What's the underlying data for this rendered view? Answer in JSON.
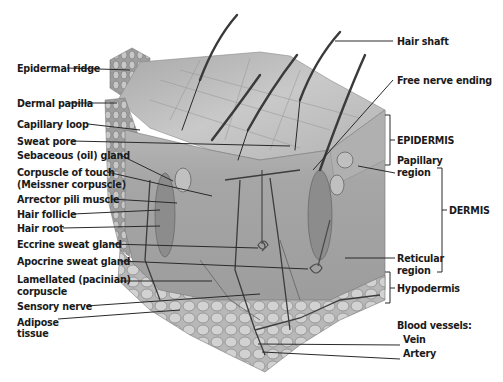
{
  "diagram": {
    "type": "anatomical-cross-section",
    "colors": {
      "background": "#ffffff",
      "label_text": "#1a1a1a",
      "leader_line": "#2a2a2a",
      "epidermis_surface": "#b9b9b9",
      "dermis": "#a8a8a8",
      "hypodermis_fat": "#c4c4c4",
      "hair": "#3a3a3a"
    },
    "left_labels": [
      {
        "id": "epidermal-ridge",
        "text": "Epidermal ridge"
      },
      {
        "id": "dermal-papilla",
        "text": "Dermal papilla"
      },
      {
        "id": "capillary-loop",
        "text": "Capillary loop"
      },
      {
        "id": "sweat-pore",
        "text": "Sweat pore"
      },
      {
        "id": "sebaceous-gland",
        "text": "Sebaceous (oil) gland"
      },
      {
        "id": "corpuscle-of-touch",
        "text": "Corpuscle of touch",
        "text2": "(Meissner corpuscle)"
      },
      {
        "id": "arrector-pili-muscle",
        "text": "Arrector pili muscle"
      },
      {
        "id": "hair-follicle",
        "text": "Hair follicle"
      },
      {
        "id": "hair-root",
        "text": "Hair root"
      },
      {
        "id": "eccrine-sweat-gland",
        "text": "Eccrine sweat gland"
      },
      {
        "id": "apocrine-sweat-gland",
        "text": "Apocrine sweat gland"
      },
      {
        "id": "lamellated-corpuscle",
        "text": "Lamellated (pacinian)",
        "text2": "corpuscle"
      },
      {
        "id": "sensory-nerve",
        "text": "Sensory nerve"
      },
      {
        "id": "adipose-tissue",
        "text": "Adipose",
        "text2": "tissue"
      }
    ],
    "right_labels": [
      {
        "id": "hair-shaft",
        "text": "Hair shaft"
      },
      {
        "id": "free-nerve-ending",
        "text": "Free nerve ending"
      },
      {
        "id": "epidermis",
        "text": "EPIDERMIS"
      },
      {
        "id": "papillary-region",
        "text": "Papillary",
        "text2": "region"
      },
      {
        "id": "dermis",
        "text": "DERMIS"
      },
      {
        "id": "reticular-region",
        "text": "Reticular",
        "text2": "region"
      },
      {
        "id": "hypodermis",
        "text": "Hypodermis"
      },
      {
        "id": "blood-vessels",
        "text": "Blood vessels:"
      },
      {
        "id": "vein",
        "text": "Vein"
      },
      {
        "id": "artery",
        "text": "Artery"
      }
    ]
  }
}
